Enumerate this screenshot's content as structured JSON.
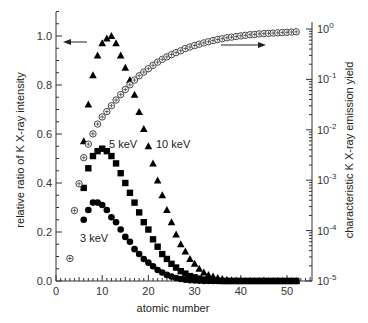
{
  "chart_data": {
    "type": "scatter",
    "title": "",
    "xlabel": "atomic number",
    "ylabel": "relative ratio of K X-ray intensity",
    "ylabel_right": "characteristic K X-ray emission yield",
    "xlim": [
      0,
      55
    ],
    "ylim": [
      0,
      1.1
    ],
    "ylim_right": [
      1e-05,
      1
    ],
    "yscale_right": "log",
    "x_ticks": [
      0,
      10,
      20,
      30,
      40,
      50
    ],
    "y_ticks": [
      "0.0",
      "0.2",
      "0.4",
      "0.6",
      "0.8",
      "1.0"
    ],
    "y_ticks_right": [
      "10^-5",
      "10^-4",
      "10^-3",
      "10^-2",
      "10^-1",
      "10^0"
    ],
    "grid": false,
    "annotations": [
      {
        "text": "3 keV",
        "x": 10,
        "y": 0.165
      },
      {
        "text": "5 keV",
        "x": 13.5,
        "y": 0.555
      },
      {
        "text": "10 keV",
        "x": 22,
        "y": 0.55
      },
      {
        "text": "arrow-left",
        "points_to": "left axis",
        "y": 0.97
      },
      {
        "text": "arrow-right",
        "points_to": "right axis",
        "y": 0.93
      }
    ],
    "series": [
      {
        "name": "3 keV",
        "marker": "filled-circle",
        "axis": "left",
        "x": [
          6,
          7,
          8,
          9,
          10,
          11,
          12,
          13,
          14,
          15,
          16,
          17,
          18,
          19,
          20,
          21,
          22,
          23,
          24,
          25,
          26,
          27,
          28,
          29,
          30,
          31,
          32,
          33,
          34,
          35,
          36,
          37,
          38,
          39,
          40,
          41,
          42,
          43,
          44,
          45,
          46,
          47,
          48,
          49,
          50,
          51,
          52
        ],
        "values": [
          0.25,
          0.29,
          0.32,
          0.32,
          0.31,
          0.29,
          0.26,
          0.24,
          0.21,
          0.18,
          0.16,
          0.13,
          0.11,
          0.09,
          0.075,
          0.06,
          0.045,
          0.035,
          0.025,
          0.018,
          0.012,
          0.008,
          0.005,
          0.003,
          0.002,
          0.001,
          0,
          0,
          0,
          0,
          0,
          0,
          0,
          0,
          0,
          0,
          0,
          0,
          0,
          0,
          0,
          0,
          0,
          0,
          0,
          0,
          0
        ]
      },
      {
        "name": "5 keV",
        "marker": "filled-square",
        "axis": "left",
        "x": [
          6,
          7,
          8,
          9,
          10,
          11,
          12,
          13,
          14,
          15,
          16,
          17,
          18,
          19,
          20,
          21,
          22,
          23,
          24,
          25,
          26,
          27,
          28,
          29,
          30,
          31,
          32,
          33,
          34,
          35,
          36,
          37,
          38,
          39,
          40,
          41,
          42,
          43,
          44,
          45,
          46,
          47,
          48,
          49,
          50,
          51,
          52
        ],
        "values": [
          0.38,
          0.46,
          0.51,
          0.53,
          0.54,
          0.53,
          0.51,
          0.48,
          0.44,
          0.4,
          0.36,
          0.32,
          0.28,
          0.24,
          0.21,
          0.17,
          0.14,
          0.11,
          0.09,
          0.07,
          0.055,
          0.04,
          0.03,
          0.02,
          0.015,
          0.01,
          0.006,
          0.004,
          0.002,
          0.001,
          0,
          0,
          0,
          0,
          0,
          0,
          0,
          0,
          0,
          0,
          0,
          0,
          0,
          0,
          0,
          0,
          0
        ]
      },
      {
        "name": "10 keV",
        "marker": "filled-triangle",
        "axis": "left",
        "x": [
          6,
          7,
          8,
          9,
          10,
          11,
          12,
          13,
          14,
          15,
          16,
          17,
          18,
          19,
          20,
          21,
          22,
          23,
          24,
          25,
          26,
          27,
          28,
          29,
          30,
          31,
          32,
          33,
          34,
          35,
          36,
          37,
          38,
          39,
          40,
          41,
          42,
          43,
          44,
          45,
          46,
          47,
          48,
          49,
          50,
          51,
          52
        ],
        "values": [
          0.57,
          0.72,
          0.84,
          0.92,
          0.97,
          0.99,
          1.0,
          0.97,
          0.92,
          0.87,
          0.82,
          0.76,
          0.69,
          0.62,
          0.55,
          0.48,
          0.41,
          0.35,
          0.29,
          0.24,
          0.19,
          0.15,
          0.12,
          0.09,
          0.07,
          0.05,
          0.035,
          0.025,
          0.018,
          0.012,
          0.008,
          0.005,
          0.003,
          0.002,
          0.001,
          0,
          0,
          0,
          0,
          0,
          0,
          0,
          0,
          0,
          0,
          0,
          0
        ]
      },
      {
        "name": "K X-ray emission yield",
        "marker": "circle-plus",
        "axis": "right",
        "x": [
          3,
          4,
          5,
          6,
          7,
          8,
          9,
          10,
          11,
          12,
          13,
          14,
          15,
          16,
          17,
          18,
          19,
          20,
          21,
          22,
          23,
          24,
          25,
          26,
          27,
          28,
          29,
          30,
          31,
          32,
          33,
          34,
          35,
          36,
          37,
          38,
          39,
          40,
          41,
          42,
          43,
          44,
          45,
          46,
          47,
          48,
          49,
          50,
          51,
          52
        ],
        "values": [
          2.8e-05,
          0.00025,
          0.00085,
          0.0028,
          0.0052,
          0.0083,
          0.013,
          0.018,
          0.023,
          0.03,
          0.039,
          0.05,
          0.063,
          0.078,
          0.097,
          0.118,
          0.14,
          0.163,
          0.19,
          0.22,
          0.25,
          0.28,
          0.31,
          0.34,
          0.37,
          0.41,
          0.44,
          0.47,
          0.5,
          0.53,
          0.56,
          0.59,
          0.62,
          0.64,
          0.67,
          0.69,
          0.71,
          0.73,
          0.75,
          0.77,
          0.78,
          0.8,
          0.81,
          0.82,
          0.83,
          0.84,
          0.85,
          0.86,
          0.87,
          0.88
        ]
      }
    ]
  }
}
